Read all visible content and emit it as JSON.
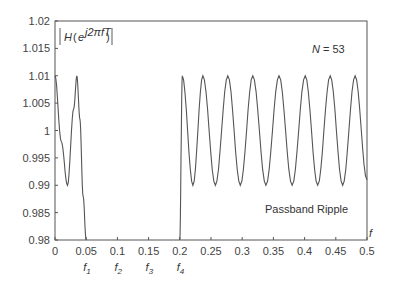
{
  "chart_data": {
    "type": "line",
    "title": "",
    "ylabel_annotation": "|H(e^{j2πfT})|",
    "xlabel": "f",
    "xlim": [
      0,
      0.5
    ],
    "ylim": [
      0.98,
      1.02
    ],
    "grid": false,
    "legend": null,
    "x_ticks": [
      "0",
      "0.05",
      "0.1",
      "0.15",
      "0.2",
      "0.25",
      "0.3",
      "0.35",
      "0.4",
      "0.45",
      "0.5"
    ],
    "y_ticks": [
      "0.98",
      "0.985",
      "0.99",
      "0.995",
      "1",
      "1.005",
      "1.01",
      "1.015",
      "1.02"
    ],
    "x_subticks": [
      {
        "x": 0.05,
        "label": "f1"
      },
      {
        "x": 0.1,
        "label": "f2"
      },
      {
        "x": 0.15,
        "label": "f3"
      },
      {
        "x": 0.2,
        "label": "f4"
      }
    ],
    "annotations": [
      {
        "text": "N = 53",
        "x": 0.44,
        "y": 1.0135
      },
      {
        "text": "Passband Ripple",
        "x": 0.34,
        "y": 0.984
      }
    ],
    "series": [
      {
        "name": "passband-1",
        "x": [
          0.0,
          0.01,
          0.02,
          0.03,
          0.035,
          0.04,
          0.045,
          0.05
        ],
        "y": [
          1.01,
          0.998,
          0.99,
          1.004,
          1.01,
          1.002,
          0.988,
          0.98
        ]
      },
      {
        "name": "passband-2",
        "x": [
          0.2,
          0.204,
          0.221,
          0.237,
          0.257,
          0.277,
          0.297,
          0.317,
          0.338,
          0.359,
          0.38,
          0.401,
          0.421,
          0.441,
          0.461,
          0.481,
          0.5
        ],
        "y": [
          0.98,
          1.01,
          0.99,
          1.01,
          0.99,
          1.01,
          0.99,
          1.01,
          0.99,
          1.01,
          0.99,
          1.01,
          0.99,
          1.01,
          0.99,
          1.01,
          0.991
        ]
      }
    ]
  }
}
